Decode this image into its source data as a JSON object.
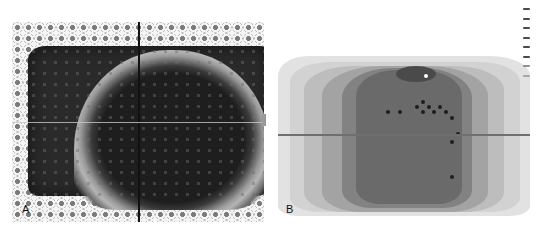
{
  "figure": {
    "panels": [
      {
        "label": "A",
        "description": "Pressure map with dotted sensor grid, dark outer region, light ring and dark central dome",
        "crosshair": {
          "vertical": true,
          "horizontal": true
        }
      },
      {
        "label": "B",
        "description": "Contoured grayscale pressure map with scatter dots and horizontal reference line",
        "legend_ticks": 8,
        "points_count": 14
      }
    ]
  }
}
